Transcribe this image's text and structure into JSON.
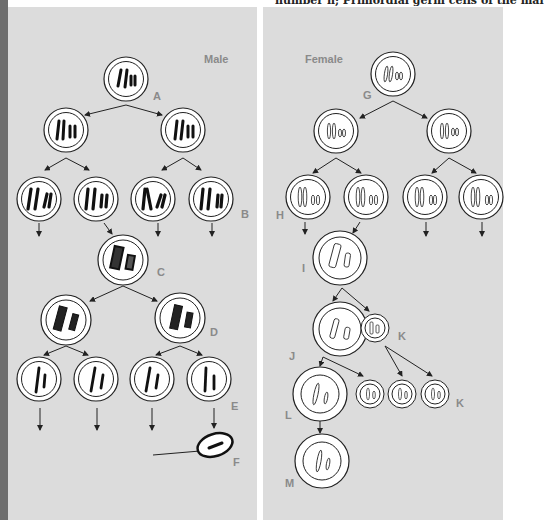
{
  "header": {
    "cropped_text": "number n; Primordial germ cells of the mal"
  },
  "male_panel": {
    "title": "Male",
    "labels": [
      "A",
      "B",
      "C",
      "D",
      "E",
      "F"
    ]
  },
  "female_panel": {
    "title": "Female",
    "labels": [
      "G",
      "H",
      "I",
      "J",
      "K",
      "K",
      "L",
      "M"
    ]
  },
  "colors": {
    "panel_bg": "#dcdcdc",
    "spine": "#6e6e6e",
    "label": "#8a8a8a",
    "ink": "#111111",
    "cell_fill": "#ffffff"
  }
}
